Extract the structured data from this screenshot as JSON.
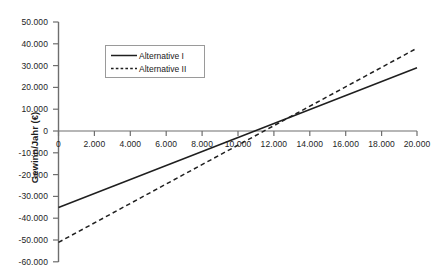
{
  "chart_data": {
    "type": "line",
    "title": "",
    "subtitle": "",
    "xlabel": "",
    "ylabel": "Gewinn/Jahr (€)",
    "xlim": [
      0,
      20000
    ],
    "ylim": [
      -60000,
      50000
    ],
    "x_ticks": [
      0,
      2000,
      4000,
      6000,
      8000,
      10000,
      12000,
      14000,
      16000,
      18000,
      20000
    ],
    "x_tick_labels": [
      "0",
      "2.000",
      "4.000",
      "6.000",
      "8.000",
      "10.000",
      "12.000",
      "14.000",
      "16.000",
      "18.000",
      "20.000"
    ],
    "y_ticks": [
      50000,
      40000,
      30000,
      20000,
      10000,
      0,
      -10000,
      -20000,
      -30000,
      -40000,
      -50000,
      -60000
    ],
    "y_tick_labels": [
      "50.000",
      "40.000",
      "30.000",
      "20.000",
      "10.000",
      "0",
      "-10.000",
      "-20.000",
      "-30.000",
      "-40.000",
      "-50.000",
      "-60.000"
    ],
    "grid": false,
    "zero_line": true,
    "legend_position": "upper-left-inside",
    "series": [
      {
        "name": "Alternative I",
        "style": "solid",
        "color": "#1f1f1f",
        "x": [
          0,
          20000
        ],
        "values": [
          -35000,
          29000
        ],
        "intercept": -35000,
        "slope": 3.2,
        "break_even_x": 10900
      },
      {
        "name": "Alternative II",
        "style": "dashed",
        "color": "#1f1f1f",
        "x": [
          0,
          20000
        ],
        "values": [
          -51000,
          38000
        ],
        "intercept": -51000,
        "slope": 4.45,
        "break_even_x": 11460
      }
    ],
    "intersection": {
      "x": 11800,
      "y": 2800
    }
  }
}
